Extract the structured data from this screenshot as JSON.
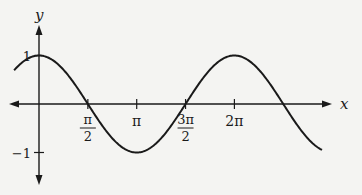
{
  "chart_data": {
    "type": "line",
    "title": "",
    "function": "y = cos(x)",
    "xlabel": "x",
    "ylabel": "y",
    "xlim": [
      -0.8,
      9.1
    ],
    "ylim": [
      -1,
      1
    ],
    "grid": false,
    "x_ticks": [
      {
        "value": 1.5708,
        "label_num": "π",
        "label_den": "2"
      },
      {
        "value": 3.1416,
        "label": "π"
      },
      {
        "value": 4.7124,
        "label_num": "3π",
        "label_den": "2"
      },
      {
        "value": 6.2832,
        "label": "2π"
      }
    ],
    "y_ticks": [
      {
        "value": 1,
        "label": "1"
      },
      {
        "value": -1,
        "label": "−1"
      }
    ],
    "series": [
      {
        "name": "cos(x)",
        "color": "#1a1a1a"
      }
    ]
  }
}
